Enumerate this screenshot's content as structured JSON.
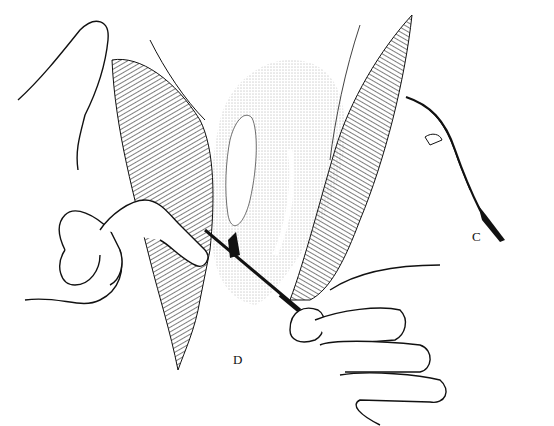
{
  "figure": {
    "labels": {
      "c": "C",
      "d": "D"
    },
    "colors": {
      "ink": "#111111",
      "background": "#ffffff",
      "stipple": "#555555"
    }
  }
}
